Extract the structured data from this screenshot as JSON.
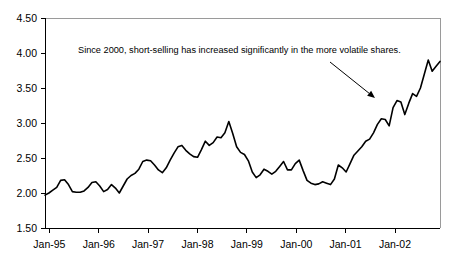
{
  "chart_data": {
    "type": "line",
    "title": "",
    "subtitle": "",
    "xlabel": "",
    "ylabel": "",
    "ylim": [
      1.5,
      4.5
    ],
    "y_ticks": [
      "1.50",
      "2.00",
      "2.50",
      "3.00",
      "3.50",
      "4.00",
      "4.50"
    ],
    "y_tick_values": [
      1.5,
      2.0,
      2.5,
      3.0,
      3.5,
      4.0,
      4.5
    ],
    "x_ticks": [
      "Jan-95",
      "Jan-96",
      "Jan-97",
      "Jan-98",
      "Jan-99",
      "Jan-00",
      "Jan-01",
      "Jan-02"
    ],
    "x_tick_values": [
      0,
      12,
      24,
      36,
      48,
      60,
      72,
      84
    ],
    "xlim": [
      0,
      96
    ],
    "grid": false,
    "legend": "none",
    "series": [
      {
        "name": "short-selling ratio",
        "values": [
          1.97,
          2.0,
          2.04,
          2.08,
          2.18,
          2.19,
          2.12,
          2.02,
          2.01,
          2.01,
          2.03,
          2.08,
          2.15,
          2.16,
          2.1,
          2.02,
          2.05,
          2.12,
          2.07,
          2.0,
          2.1,
          2.2,
          2.25,
          2.28,
          2.34,
          2.45,
          2.47,
          2.46,
          2.4,
          2.33,
          2.29,
          2.36,
          2.47,
          2.57,
          2.66,
          2.68,
          2.61,
          2.56,
          2.52,
          2.51,
          2.62,
          2.74,
          2.68,
          2.72,
          2.8,
          2.79,
          2.86,
          3.02,
          2.85,
          2.66,
          2.58,
          2.55,
          2.46,
          2.3,
          2.22,
          2.26,
          2.34,
          2.31,
          2.27,
          2.31,
          2.38,
          2.45,
          2.33,
          2.33,
          2.42,
          2.47,
          2.32,
          2.18,
          2.14,
          2.12,
          2.13,
          2.16,
          2.14,
          2.12,
          2.2,
          2.4,
          2.36,
          2.3,
          2.42,
          2.54,
          2.6,
          2.66,
          2.74,
          2.77,
          2.86,
          2.98,
          3.06,
          3.05,
          2.96,
          3.22,
          3.32,
          3.3,
          3.12,
          3.28,
          3.42,
          3.38,
          3.5,
          3.7,
          3.9,
          3.74,
          3.81,
          3.88
        ]
      }
    ],
    "annotations": [
      {
        "name": "trend-note",
        "text": "Since 2000, short-selling has increased significantly in the more volatile shares.",
        "arrow": {
          "from_x": 330,
          "from_y": 62,
          "to_x": 375,
          "to_y": 98
        }
      }
    ],
    "colors": {
      "line": "#000000",
      "axis": "#000000",
      "frame": "#9a9a9a",
      "background": "#ffffff"
    }
  }
}
